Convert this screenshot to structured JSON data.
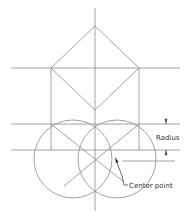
{
  "diagram": {
    "labels": {
      "radius": "Radius",
      "center_point": "Center point"
    },
    "colors": {
      "line": "#8a8a8a",
      "dim": "#555555",
      "text": "#333333",
      "background": "#ffffff"
    }
  }
}
